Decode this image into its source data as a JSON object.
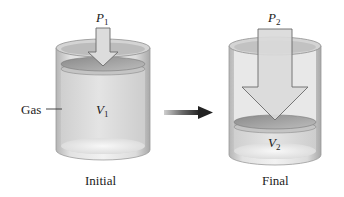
{
  "diagram": {
    "initial": {
      "caption": "Initial",
      "pressure_symbol": "P",
      "pressure_subscript": "1",
      "volume_symbol": "V",
      "volume_subscript": "1",
      "gas_label": "Gas"
    },
    "final": {
      "caption": "Final",
      "pressure_symbol": "P",
      "pressure_subscript": "2",
      "volume_symbol": "V",
      "volume_subscript": "2"
    },
    "transition_arrow": "right-arrow-icon",
    "colors": {
      "cylinder_wall": "#c8c8c8",
      "cylinder_inner": "#e6e6e6",
      "gas_fill": "#dcdcdc",
      "piston": "#9a9a9a",
      "pressure_arrow_fill": "#d9d9d9",
      "pressure_arrow_stroke": "#6a6a6a",
      "transition_arrow": "#333333"
    }
  }
}
